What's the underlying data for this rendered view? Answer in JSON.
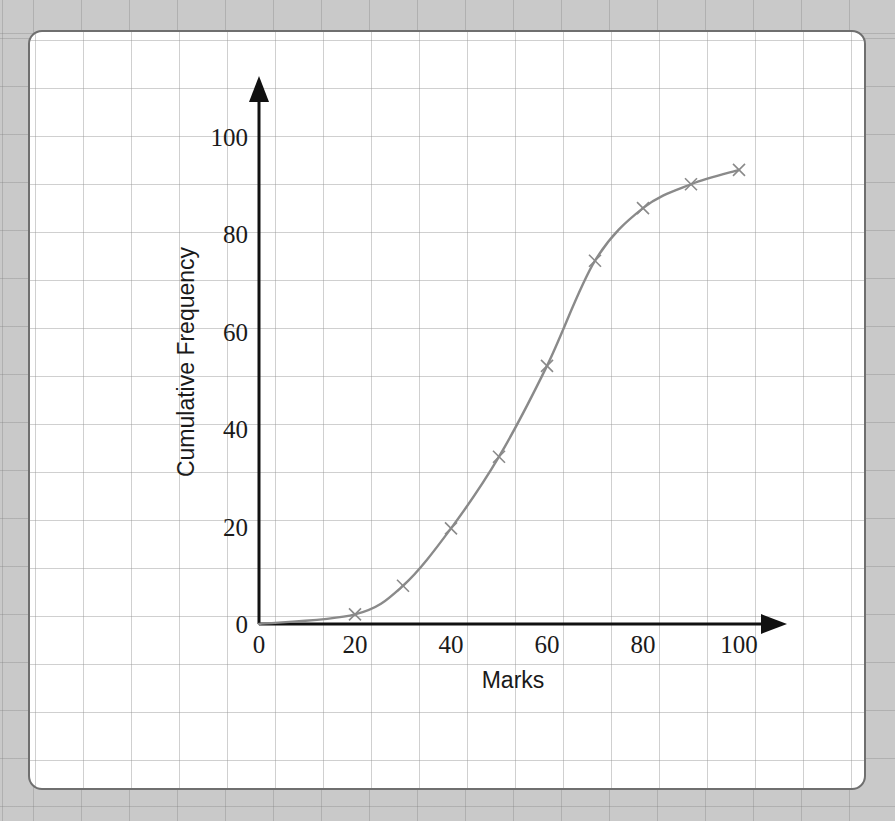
{
  "chart_data": {
    "type": "line",
    "title": "",
    "subtitle": "",
    "xlabel": "Marks",
    "ylabel": "Cumulative Frequency",
    "xlim": [
      0,
      100
    ],
    "ylim": [
      0,
      100
    ],
    "xticks": [
      "0",
      "20",
      "40",
      "60",
      "80",
      "100"
    ],
    "xtick_values": [
      0,
      20,
      40,
      60,
      80,
      100
    ],
    "yticks": [
      "0",
      "20",
      "40",
      "60",
      "80",
      "100"
    ],
    "ytick_values": [
      0,
      20,
      40,
      60,
      80,
      100
    ],
    "grid": true,
    "grid_style": "dotted",
    "legend": "none",
    "marker": "x",
    "line_color": "#8a8a8a",
    "marker_color": "#8a8a8a",
    "axis_color": "#111111",
    "series": [
      {
        "name": "Cumulative frequency",
        "x": [
          0,
          20,
          30,
          40,
          50,
          60,
          70,
          80,
          90,
          100
        ],
        "values": [
          0,
          2,
          8,
          20,
          35,
          54,
          76,
          87,
          92,
          95
        ]
      }
    ],
    "origin_label": "0"
  },
  "canvas": {
    "background_color": "#c9c9c9",
    "card_background": "#ffffff",
    "card_border_color": "#6f6f6f"
  }
}
